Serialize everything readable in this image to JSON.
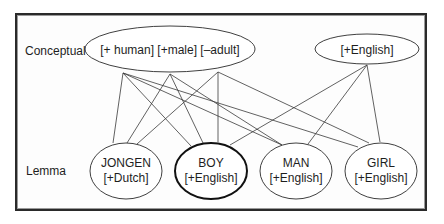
{
  "levels": {
    "conceptual": "Conceptual",
    "lemma": "Lemma"
  },
  "conceptual_nodes": {
    "features": {
      "text": "[+ human] [+male] [–adult]",
      "items": [
        "[+ human]",
        "[+male]",
        "[–adult]"
      ]
    },
    "language": {
      "text": "[+English]"
    }
  },
  "lemma_nodes": [
    {
      "word": "JONGEN",
      "feature": "[+Dutch]",
      "highlighted": false
    },
    {
      "word": "BOY",
      "feature": "[+English]",
      "highlighted": true
    },
    {
      "word": "MAN",
      "feature": "[+English]",
      "highlighted": false
    },
    {
      "word": "GIRL",
      "feature": "[+English]",
      "highlighted": false
    }
  ],
  "connections": [
    {
      "from": "[+ human]",
      "to": "JONGEN"
    },
    {
      "from": "[+ human]",
      "to": "BOY"
    },
    {
      "from": "[+ human]",
      "to": "MAN"
    },
    {
      "from": "[+ human]",
      "to": "GIRL"
    },
    {
      "from": "[+male]",
      "to": "JONGEN"
    },
    {
      "from": "[+male]",
      "to": "BOY"
    },
    {
      "from": "[+male]",
      "to": "MAN"
    },
    {
      "from": "[–adult]",
      "to": "JONGEN"
    },
    {
      "from": "[–adult]",
      "to": "BOY"
    },
    {
      "from": "[–adult]",
      "to": "GIRL"
    },
    {
      "from": "[+English]",
      "to": "BOY"
    },
    {
      "from": "[+English]",
      "to": "MAN"
    },
    {
      "from": "[+English]",
      "to": "GIRL"
    }
  ],
  "colors": {
    "stroke": "#2a2a2a",
    "highlight_stroke": "#111111",
    "text": "#1e1e1e"
  }
}
